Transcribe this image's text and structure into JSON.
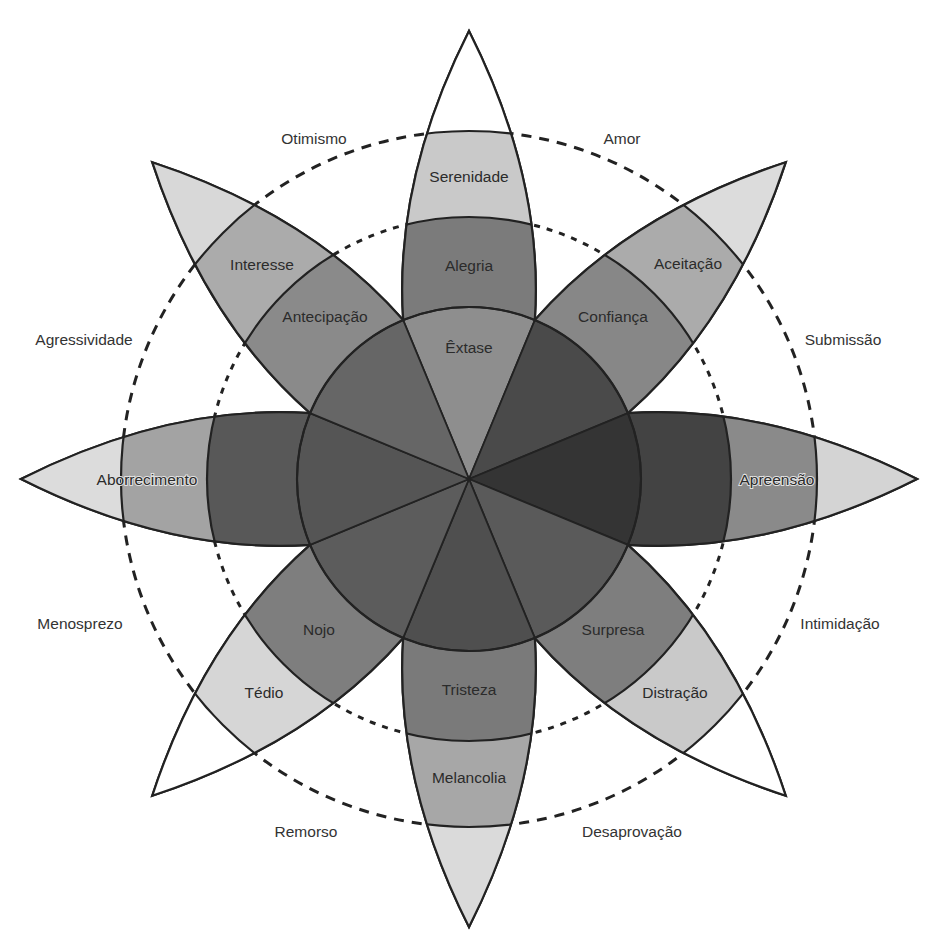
{
  "diagram": {
    "center": [
      469,
      479
    ],
    "radii": {
      "core": 172,
      "inner_ring": 262,
      "outer_ring": 348,
      "tip": 448
    },
    "petals": [
      {
        "direction": "N",
        "angle": 0,
        "core_label": "Êxtase",
        "inner_label": "Alegria",
        "outer_label": "Serenidade",
        "core_color": "#8e8e8e",
        "inner_color": "#7b7b7b",
        "outer_color": "#c9c9c9",
        "tip_color": "#ffffff"
      },
      {
        "direction": "NE",
        "angle": 45,
        "core_label": "",
        "inner_label": "Confiança",
        "outer_label": "Aceitação",
        "core_color": "#4a4a4a",
        "inner_color": "#878787",
        "outer_color": "#ababab",
        "tip_color": "#dcdcdc"
      },
      {
        "direction": "E",
        "angle": 90,
        "core_label": "",
        "inner_label": "",
        "outer_label": "Apreensão",
        "core_color": "#343434",
        "inner_color": "#434343",
        "outer_color": "#8a8a8a",
        "tip_color": "#d4d4d4"
      },
      {
        "direction": "SE",
        "angle": 135,
        "core_label": "",
        "inner_label": "Surpresa",
        "outer_label": "Distração",
        "core_color": "#5a5a5a",
        "inner_color": "#7e7e7e",
        "outer_color": "#c9c9c9",
        "tip_color": "#ffffff"
      },
      {
        "direction": "S",
        "angle": 180,
        "core_label": "",
        "inner_label": "Tristeza",
        "outer_label": "Melancolia",
        "core_color": "#4f4f4f",
        "inner_color": "#7a7a7a",
        "outer_color": "#a7a7a7",
        "tip_color": "#dadada"
      },
      {
        "direction": "SW",
        "angle": 225,
        "core_label": "",
        "inner_label": "Nojo",
        "outer_label": "Tédio",
        "core_color": "#5c5c5c",
        "inner_color": "#7e7e7e",
        "outer_color": "#d6d6d6",
        "tip_color": "#ffffff"
      },
      {
        "direction": "W",
        "angle": 270,
        "core_label": "",
        "inner_label": "",
        "outer_label": "Aborrecimento",
        "core_color": "#555555",
        "inner_color": "#585858",
        "outer_color": "#a3a3a3",
        "tip_color": "#dcdcdc"
      },
      {
        "direction": "NW",
        "angle": 315,
        "core_label": "",
        "inner_label": "Antecipação",
        "outer_label": "Interesse",
        "core_color": "#666666",
        "inner_color": "#8a8a8a",
        "outer_color": "#ababab",
        "tip_color": "#d8d8d8"
      }
    ],
    "dyads": [
      {
        "label": "Otimismo",
        "x": 314,
        "y": 140
      },
      {
        "label": "Amor",
        "x": 622,
        "y": 140
      },
      {
        "label": "Agressividade",
        "x": 84,
        "y": 341
      },
      {
        "label": "Submissão",
        "x": 843,
        "y": 341
      },
      {
        "label": "Menosprezo",
        "x": 80,
        "y": 625
      },
      {
        "label": "Intimidação",
        "x": 840,
        "y": 625
      },
      {
        "label": "Remorso",
        "x": 306,
        "y": 833
      },
      {
        "label": "Desaprovação",
        "x": 632,
        "y": 833
      }
    ],
    "label_positions": {
      "core": [
        [
          469,
          349
        ]
      ],
      "inner": [
        [
          469,
          267
        ],
        [
          613,
          318
        ],
        [
          0,
          0
        ],
        [
          613,
          631
        ],
        [
          469,
          691
        ],
        [
          319,
          631
        ],
        [
          0,
          0
        ],
        [
          325,
          318
        ]
      ],
      "outer": [
        [
          469,
          178
        ],
        [
          688,
          265
        ],
        [
          777,
          481
        ],
        [
          675,
          694
        ],
        [
          469,
          779
        ],
        [
          264,
          694
        ],
        [
          147,
          481
        ],
        [
          262,
          266
        ]
      ]
    }
  }
}
